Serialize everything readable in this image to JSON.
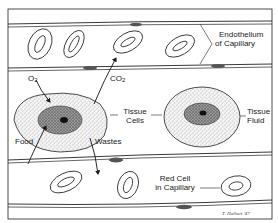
{
  "diagram": {
    "labels": {
      "endothelium_line1": "Endothelium",
      "endothelium_line2": "of Capillary",
      "o2": "O",
      "o2_sub": "2",
      "co2": "CO",
      "co2_sub": "2",
      "tissue_cells_line1": "Tissue",
      "tissue_cells_line2": "Cells",
      "tissue_fluid_line1": "Tissue",
      "tissue_fluid_line2": "Fluid",
      "food": "Food",
      "wastes": "Wastes",
      "red_cell_line1": "Red Cell",
      "red_cell_line2": "in Capillary",
      "signature": "T. Halbert '47"
    },
    "colors": {
      "line": "#1a1a1a",
      "stipple": "#7a7a7a",
      "nucleus": "#3a3a3a",
      "background": "#ffffff"
    }
  }
}
